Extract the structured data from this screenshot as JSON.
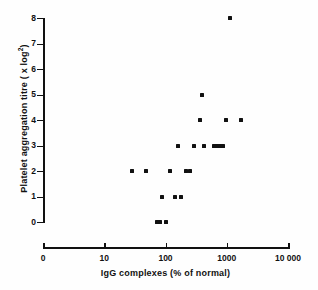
{
  "chart_data": {
    "type": "scatter",
    "title": "",
    "xlabel": "IgG complexes (% of normal)",
    "ylabel": "Platelet aggregation titre ( x log²)",
    "ylabel_main": "Platelet aggregation titre ( x log",
    "ylabel_sup": "2",
    "ylabel_close": ")",
    "grid": false,
    "legend": "none",
    "xscale": "log",
    "yscale": "linear",
    "xlim": [
      1,
      10000
    ],
    "ylim": [
      0,
      8
    ],
    "xticks": [
      1,
      10,
      100,
      1000,
      10000
    ],
    "xticklabels": [
      "0",
      "10",
      "100",
      "1000",
      "10 000"
    ],
    "yticks": [
      0,
      1,
      2,
      3,
      4,
      5,
      6,
      7,
      8
    ],
    "yticklabels": [
      "0",
      "1",
      "2",
      "3",
      "4",
      "5",
      "6",
      "7",
      "8"
    ],
    "marker": "square",
    "marker_color": "#111111",
    "marker_size_px": 4,
    "n_points": 28,
    "points": [
      {
        "x": 1150,
        "y": 8
      },
      {
        "x": 400,
        "y": 5
      },
      {
        "x": 360,
        "y": 4
      },
      {
        "x": 990,
        "y": 4
      },
      {
        "x": 1700,
        "y": 4
      },
      {
        "x": 160,
        "y": 3
      },
      {
        "x": 290,
        "y": 3
      },
      {
        "x": 430,
        "y": 3
      },
      {
        "x": 620,
        "y": 3
      },
      {
        "x": 650,
        "y": 3
      },
      {
        "x": 700,
        "y": 3
      },
      {
        "x": 790,
        "y": 3
      },
      {
        "x": 870,
        "y": 3
      },
      {
        "x": 28,
        "y": 2
      },
      {
        "x": 48,
        "y": 2
      },
      {
        "x": 120,
        "y": 2
      },
      {
        "x": 215,
        "y": 2
      },
      {
        "x": 255,
        "y": 2
      },
      {
        "x": 88,
        "y": 1
      },
      {
        "x": 145,
        "y": 1
      },
      {
        "x": 180,
        "y": 1
      },
      {
        "x": 73,
        "y": 0
      },
      {
        "x": 80,
        "y": 0
      },
      {
        "x": 100,
        "y": 0
      }
    ]
  },
  "axes": {
    "x": {
      "title": "IgG complexes (% of normal)",
      "ticks": [
        {
          "value": 1,
          "label": "0"
        },
        {
          "value": 10,
          "label": "10"
        },
        {
          "value": 100,
          "label": "100"
        },
        {
          "value": 1000,
          "label": "1000"
        },
        {
          "value": 10000,
          "label": "10 000"
        }
      ]
    },
    "y": {
      "title_main": "Platelet aggregation titre ( x log",
      "title_sup": "2",
      "title_close": ")",
      "ticks": [
        {
          "value": 8,
          "label": "8"
        },
        {
          "value": 7,
          "label": "7"
        },
        {
          "value": 6,
          "label": "6"
        },
        {
          "value": 5,
          "label": "5"
        },
        {
          "value": 4,
          "label": "4"
        },
        {
          "value": 3,
          "label": "3"
        },
        {
          "value": 2,
          "label": "2"
        },
        {
          "value": 1,
          "label": "1"
        },
        {
          "value": 0,
          "label": "0"
        }
      ]
    }
  }
}
